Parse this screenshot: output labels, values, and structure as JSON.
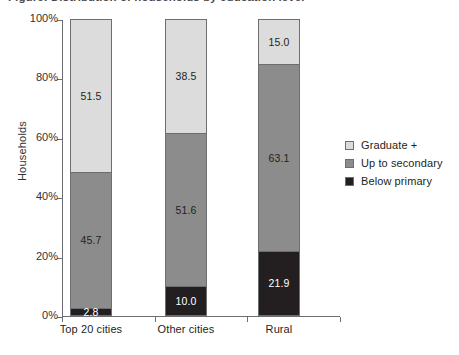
{
  "title": {
    "text": "Figure: Distribution of households by education level"
  },
  "chart_data": {
    "type": "bar",
    "subtype": "stacked-bar-100",
    "title": "",
    "xlabel": "",
    "ylabel": "Households",
    "ylim": [
      0,
      100
    ],
    "ytick_labels": [
      "0%",
      "20%",
      "40%",
      "60%",
      "80%",
      "100%"
    ],
    "ytick_values": [
      0,
      20,
      40,
      60,
      80,
      100
    ],
    "grid": false,
    "legend_position": "right",
    "categories": [
      "Top 20 cities",
      "Other cities",
      "Rural"
    ],
    "series": [
      {
        "name": "Below primary",
        "color": "#231f20",
        "label_color": "#ffffff",
        "values": [
          2.8,
          10.0,
          21.9
        ],
        "labels": [
          "2.8",
          "10.0",
          "21.9"
        ]
      },
      {
        "name": "Up to secondary",
        "color": "#8c8c8c",
        "label_color": "#231f20",
        "values": [
          45.7,
          51.6,
          63.1
        ],
        "labels": [
          "45.7",
          "51.6",
          "63.1"
        ]
      },
      {
        "name": "Graduate +",
        "color": "#dcdcdc",
        "label_color": "#231f20",
        "values": [
          51.5,
          38.5,
          15.0
        ],
        "labels": [
          "51.5",
          "38.5",
          "15.0"
        ]
      }
    ],
    "legend_entries": [
      "Graduate +",
      "Up to secondary",
      "Below primary"
    ]
  },
  "axis": {
    "y_label": "Households",
    "ticks": [
      {
        "label": "100%",
        "value": 100
      },
      {
        "label": "80%",
        "value": 80
      },
      {
        "label": "60%",
        "value": 60
      },
      {
        "label": "40%",
        "value": 40
      },
      {
        "label": "20%",
        "value": 20
      },
      {
        "label": "0%",
        "value": 0
      }
    ]
  },
  "bars": [
    {
      "category": "Top 20 cities",
      "segments": [
        {
          "name": "Graduate +",
          "label": "51.5",
          "value": 51.5,
          "color": "#dcdcdc",
          "text_color": "#231f20"
        },
        {
          "name": "Up to secondary",
          "label": "45.7",
          "value": 45.7,
          "color": "#8c8c8c",
          "text_color": "#231f20"
        },
        {
          "name": "Below primary",
          "label": "2.8",
          "value": 2.8,
          "color": "#231f20",
          "text_color": "#ffffff"
        }
      ]
    },
    {
      "category": "Other cities",
      "segments": [
        {
          "name": "Graduate +",
          "label": "38.5",
          "value": 38.5,
          "color": "#dcdcdc",
          "text_color": "#231f20"
        },
        {
          "name": "Up to secondary",
          "label": "51.6",
          "value": 51.6,
          "color": "#8c8c8c",
          "text_color": "#231f20"
        },
        {
          "name": "Below primary",
          "label": "10.0",
          "value": 10.0,
          "color": "#231f20",
          "text_color": "#ffffff"
        }
      ]
    },
    {
      "category": "Rural",
      "segments": [
        {
          "name": "Graduate +",
          "label": "15.0",
          "value": 15.0,
          "color": "#dcdcdc",
          "text_color": "#231f20"
        },
        {
          "name": "Up to secondary",
          "label": "63.1",
          "value": 63.1,
          "color": "#8c8c8c",
          "text_color": "#231f20"
        },
        {
          "name": "Below primary",
          "label": "21.9",
          "value": 21.9,
          "color": "#231f20",
          "text_color": "#ffffff"
        }
      ]
    }
  ],
  "legend": {
    "items": [
      {
        "label": "Graduate +",
        "color": "#dcdcdc"
      },
      {
        "label": "Up to secondary",
        "color": "#8c8c8c"
      },
      {
        "label": "Below primary",
        "color": "#231f20"
      }
    ]
  }
}
